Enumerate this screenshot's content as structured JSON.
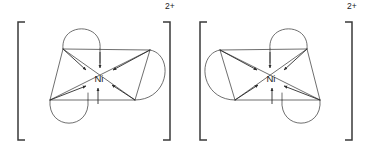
{
  "figure": {
    "type": "chemical-structure-diagram",
    "background_color": "#ffffff",
    "line_color": "#4a4a4a",
    "arrow_color": "#2b2b2b",
    "bracket_color": "#3a3a3a",
    "text_color": "#1a1a1a"
  },
  "complexes": [
    {
      "id": "left-complex",
      "chirality": "delta-isomer",
      "metal_label": "Ni",
      "charge_label": "2+",
      "coordination_number": 6,
      "geometry": "octahedral",
      "chelate_ring_count": 3,
      "donor_arrow_count": 6,
      "bracket": {
        "left_x": 18,
        "right_x": 170,
        "top_y": 22,
        "bottom_y": 140,
        "arm_length": 7
      },
      "center": {
        "x": 99,
        "y": 78
      },
      "vertices": {
        "upper_left": {
          "x": 63,
          "y": 49
        },
        "lower_left": {
          "x": 50,
          "y": 100
        },
        "upper_right": {
          "x": 150,
          "y": 50
        },
        "lower_right": {
          "x": 135,
          "y": 100
        },
        "top_stem": {
          "x": 100,
          "y": 49
        },
        "bottom_stem": {
          "x": 88,
          "y": 100
        }
      },
      "chelate_lobes": [
        {
          "name": "top-lobe",
          "x1": 63,
          "y1": 49,
          "x2": 100,
          "y2": 49,
          "bulge": "up"
        },
        {
          "name": "bottom-lobe",
          "x1": 50,
          "y1": 100,
          "x2": 88,
          "y2": 100,
          "bulge": "down"
        },
        {
          "name": "right-lobe",
          "x1": 150,
          "y1": 50,
          "x2": 135,
          "y2": 100,
          "bulge": "right"
        }
      ],
      "charge_position": {
        "x": 165,
        "y": 3
      }
    },
    {
      "id": "right-complex",
      "chirality": "lambda-isomer",
      "metal_label": "Ni",
      "charge_label": "2+",
      "coordination_number": 6,
      "geometry": "octahedral",
      "chelate_ring_count": 3,
      "donor_arrow_count": 6,
      "bracket": {
        "left_x": 200,
        "right_x": 352,
        "top_y": 22,
        "bottom_y": 140,
        "arm_length": 7
      },
      "center": {
        "x": 271,
        "y": 78
      },
      "vertices": {
        "upper_right": {
          "x": 307,
          "y": 49
        },
        "lower_right": {
          "x": 320,
          "y": 100
        },
        "upper_left": {
          "x": 220,
          "y": 50
        },
        "lower_left": {
          "x": 235,
          "y": 100
        },
        "top_stem": {
          "x": 270,
          "y": 49
        },
        "bottom_stem": {
          "x": 282,
          "y": 100
        }
      },
      "chelate_lobes": [
        {
          "name": "top-lobe",
          "x1": 307,
          "y1": 49,
          "x2": 270,
          "y2": 49,
          "bulge": "up"
        },
        {
          "name": "bottom-lobe",
          "x1": 320,
          "y1": 100,
          "x2": 282,
          "y2": 100,
          "bulge": "down"
        },
        {
          "name": "left-lobe",
          "x1": 220,
          "y1": 50,
          "x2": 235,
          "y2": 100,
          "bulge": "left"
        }
      ],
      "charge_position": {
        "x": 347,
        "y": 3
      }
    }
  ],
  "labels": {
    "metal_symbol": "Ni",
    "ionic_charge": "2+"
  }
}
